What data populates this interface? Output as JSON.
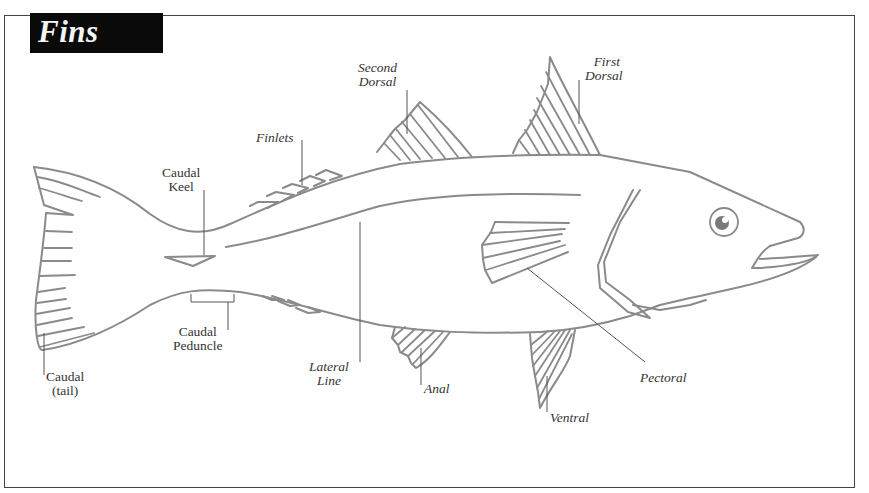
{
  "title": "Fins",
  "colors": {
    "title_bg": "#0a0a0a",
    "title_text": "#f4f4f4",
    "outline": "#8a8a8a",
    "leader": "#555555",
    "label_text": "#333333",
    "frame": "#444444"
  },
  "labels": {
    "second_dorsal": {
      "line1": "Second",
      "line2": "Dorsal"
    },
    "first_dorsal": {
      "line1": "First",
      "line2": "Dorsal"
    },
    "finlets": {
      "line1": "Finlets"
    },
    "caudal_keel": {
      "line1": "Caudal",
      "line2": "Keel"
    },
    "caudal_peduncle": {
      "line1": "Caudal",
      "line2": "Peduncle"
    },
    "caudal_tail": {
      "line1": "Caudal",
      "line2": "(tail)"
    },
    "lateral_line": {
      "line1": "Lateral",
      "line2": "Line"
    },
    "anal": {
      "line1": "Anal"
    },
    "ventral": {
      "line1": "Ventral"
    },
    "pectoral": {
      "line1": "Pectoral"
    }
  }
}
